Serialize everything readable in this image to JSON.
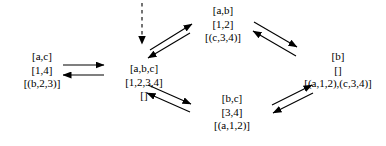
{
  "diagram": {
    "type": "state-transition-graph",
    "nodes": [
      {
        "id": "left",
        "lines": [
          "[a,c]",
          "[1,4]",
          "[(b,2,3)]"
        ]
      },
      {
        "id": "center",
        "lines": [
          "[a,b,c]",
          "[1,2,3,4]",
          "[]"
        ]
      },
      {
        "id": "top",
        "lines": [
          "[a,b]",
          "[1,2]",
          "[(c,3,4)]"
        ]
      },
      {
        "id": "right",
        "lines": [
          "[b]",
          "[]",
          "[(a,1,2),(c,3,4)]"
        ]
      },
      {
        "id": "bottom",
        "lines": [
          "[b,c]",
          "[3,4]",
          "[(a,1,2)]"
        ]
      }
    ],
    "edges": [
      {
        "id": "entry-dashed",
        "from": "start",
        "to": "center",
        "style": "dashed"
      },
      {
        "id": "left-to-center",
        "from": "left",
        "to": "center",
        "style": "solid"
      },
      {
        "id": "center-to-left",
        "from": "center",
        "to": "left",
        "style": "solid"
      },
      {
        "id": "center-to-top",
        "from": "center",
        "to": "top",
        "style": "solid"
      },
      {
        "id": "top-to-center",
        "from": "top",
        "to": "center",
        "style": "solid"
      },
      {
        "id": "top-to-right",
        "from": "top",
        "to": "right",
        "style": "solid"
      },
      {
        "id": "right-to-top",
        "from": "right",
        "to": "top",
        "style": "solid"
      },
      {
        "id": "center-to-bottom",
        "from": "center",
        "to": "bottom",
        "style": "solid"
      },
      {
        "id": "bottom-to-center",
        "from": "bottom",
        "to": "center",
        "style": "solid"
      },
      {
        "id": "bottom-to-right",
        "from": "bottom",
        "to": "right",
        "style": "solid"
      },
      {
        "id": "right-to-bottom",
        "from": "right",
        "to": "bottom",
        "style": "solid"
      }
    ],
    "colors": {
      "stroke": "#000000",
      "text": "#000000",
      "background": "#ffffff"
    }
  }
}
